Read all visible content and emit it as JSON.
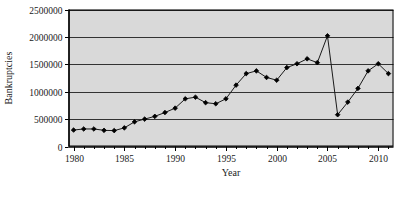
{
  "chart_data": {
    "type": "line",
    "title": "",
    "subtitle": "",
    "xlabel": "Year",
    "ylabel": "Bankruptcies",
    "xlim": [
      1979.5,
      2011.5
    ],
    "ylim": [
      0,
      2500000
    ],
    "grid": "horizontal",
    "legend": "none",
    "marker": "diamond",
    "plot_background": "#d9d9d9",
    "line_color": "#1a1a1a",
    "marker_color": "#000000",
    "border_color": "#000000",
    "xticks": [
      1980,
      1985,
      1990,
      1995,
      2000,
      2005,
      2010
    ],
    "xtick_labels": [
      "1980",
      "1985",
      "1990",
      "1995",
      "2000",
      "2005",
      "2010"
    ],
    "xminor_tick_interval": 1,
    "yticks": [
      0,
      500000,
      1000000,
      1500000,
      2000000,
      2500000
    ],
    "ytick_labels": [
      "0",
      "500000",
      "1000000",
      "1500000",
      "2000000",
      "2500000"
    ],
    "x": [
      1980,
      1981,
      1982,
      1983,
      1984,
      1985,
      1986,
      1987,
      1988,
      1989,
      1990,
      1991,
      1992,
      1993,
      1994,
      1995,
      1996,
      1997,
      1998,
      1999,
      2000,
      2001,
      2002,
      2003,
      2004,
      2005,
      2006,
      2007,
      2008,
      2009,
      2010,
      2011
    ],
    "values": [
      300000,
      320000,
      320000,
      295000,
      290000,
      340000,
      450000,
      500000,
      550000,
      620000,
      700000,
      870000,
      900000,
      800000,
      780000,
      870000,
      1120000,
      1330000,
      1380000,
      1260000,
      1210000,
      1440000,
      1510000,
      1600000,
      1530000,
      2020000,
      580000,
      810000,
      1060000,
      1380000,
      1510000,
      1330000
    ],
    "series": [
      {
        "name": "Bankruptcies",
        "values": [
          300000,
          320000,
          320000,
          295000,
          290000,
          340000,
          450000,
          500000,
          550000,
          620000,
          700000,
          870000,
          900000,
          800000,
          780000,
          870000,
          1120000,
          1330000,
          1380000,
          1260000,
          1210000,
          1440000,
          1510000,
          1600000,
          1530000,
          2020000,
          580000,
          810000,
          1060000,
          1380000,
          1510000,
          1330000
        ]
      }
    ],
    "annotations": []
  }
}
